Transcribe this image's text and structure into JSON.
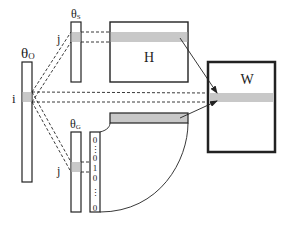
{
  "diagram": {
    "colors": {
      "stroke": "#222222",
      "highlight": "#c8c8c8",
      "background": "#ffffff"
    },
    "theta_o": {
      "label": "θ",
      "subscript": "O",
      "row_label": "i"
    },
    "theta_s": {
      "label": "θ",
      "subscript": "S",
      "row_label": "j"
    },
    "theta_g": {
      "label": "θ",
      "subscript": "G",
      "row_label": "j"
    },
    "matrix_h": {
      "label": "H"
    },
    "matrix_w": {
      "label": "W"
    },
    "one_hot": {
      "entries": [
        "0",
        "⋮",
        "0",
        "1",
        "0",
        "⋮",
        "0"
      ]
    }
  }
}
